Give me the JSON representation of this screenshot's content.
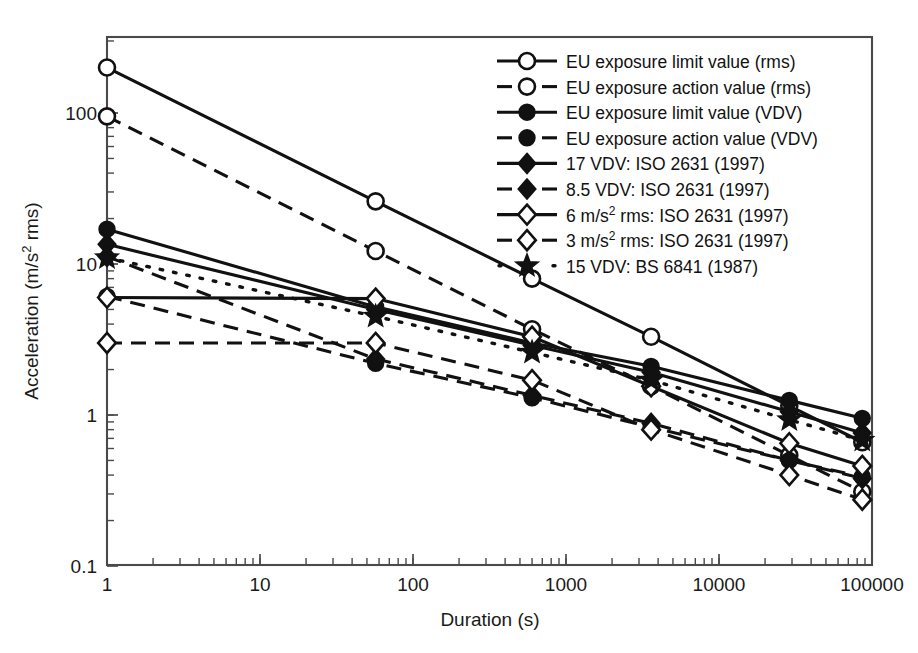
{
  "chart_data": {
    "type": "line",
    "title": "",
    "xlabel": "Duration (s)",
    "ylabel": "Acceleration (m/s² rms)",
    "xscale": "log",
    "yscale": "log",
    "xlim": [
      1,
      100000
    ],
    "ylim": [
      0.1,
      300
    ],
    "xticks": [
      1,
      10,
      100,
      1000,
      10000,
      100000
    ],
    "xtick_labels": [
      "1",
      "10",
      "100",
      "1000",
      "10000",
      "100000"
    ],
    "yticks": [
      0.1,
      1,
      10,
      100
    ],
    "ytick_labels": [
      "0.1",
      "1",
      "10",
      "100"
    ],
    "grid": false,
    "legend_position": "top-right",
    "x": [
      1,
      57,
      600,
      3600,
      28800,
      86400
    ],
    "series": [
      {
        "name": "EU exposure limit value (rms)",
        "marker": "open-circle",
        "linestyle": "solid",
        "values": [
          200,
          26,
          8.0,
          3.3,
          1.15,
          0.66
        ]
      },
      {
        "name": "EU exposure action value (rms)",
        "marker": "open-circle",
        "linestyle": "dashed",
        "values": [
          95,
          12.2,
          3.7,
          1.55,
          0.54,
          0.31
        ]
      },
      {
        "name": "EU exposure limit value (VDV)",
        "marker": "filled-circle",
        "linestyle": "solid",
        "values": [
          17,
          5.2,
          3.0,
          2.1,
          1.25,
          0.95
        ]
      },
      {
        "name": "EU exposure action value (VDV)",
        "marker": "filled-circle",
        "linestyle": "dashed",
        "values": [
          6.1,
          2.2,
          1.3,
          0.83,
          0.5,
          0.39
        ]
      },
      {
        "name": "17 VDV: ISO 2631 (1997)",
        "marker": "filled-diamond",
        "linestyle": "solid",
        "values": [
          13.5,
          5.0,
          2.9,
          1.92,
          1.05,
          0.76
        ]
      },
      {
        "name": "8.5 VDV: ISO 2631 (1997)",
        "marker": "filled-diamond",
        "linestyle": "dashed",
        "values": [
          11.2,
          2.35,
          1.35,
          0.88,
          0.5,
          0.38
        ]
      },
      {
        "name": "6 m/s² rms: ISO 2631 (1997)",
        "marker": "open-diamond",
        "linestyle": "solid",
        "values": [
          6.0,
          6.0,
          6.0,
          6.0,
          6.0,
          6.0
        ]
      },
      {
        "name": "3 m/s² rms: ISO 2631 (1997)",
        "marker": "open-diamond",
        "linestyle": "dashed",
        "values": [
          3.0,
          3.0,
          3.0,
          3.0,
          3.0,
          3.0
        ]
      },
      {
        "name": "15 VDV: BS 6841 (1987)",
        "marker": "filled-star",
        "linestyle": "dotted",
        "values": [
          11.0,
          4.5,
          2.6,
          1.7,
          0.93,
          0.68
        ]
      }
    ],
    "series_overrides": {
      "6 m/s² rms: ISO 2631 (1997)": [
        6.0,
        5.9,
        3.3,
        1.55,
        0.65,
        0.46
      ],
      "3 m/s² rms: ISO 2631 (1997)": [
        3.0,
        3.0,
        1.7,
        0.8,
        0.4,
        0.275
      ]
    },
    "colors": {
      "line": "#111111",
      "frame": "#4a4a4a",
      "background": "#ffffff"
    }
  }
}
